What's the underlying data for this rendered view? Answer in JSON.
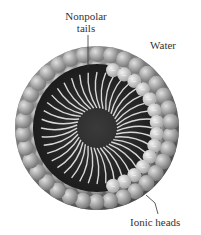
{
  "diagram": {
    "labels": {
      "nonpolar_tails": "Nonpolar\ntails",
      "nonpolar_line1": "Nonpolar",
      "nonpolar_line2": "tails",
      "water": "Water",
      "ionic_heads": "Ionic heads"
    },
    "head_charge_symbol": "−",
    "colors": {
      "head_outer": "#8a8a8a",
      "head_inner": "#c8c8c8",
      "core": "#2a2a2a",
      "tail": "#d8d8d8",
      "label": "#333333"
    }
  }
}
